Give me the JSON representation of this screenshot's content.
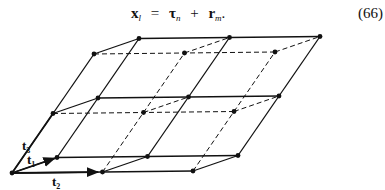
{
  "equation": {
    "lhs": "x",
    "lhs_sub": "l",
    "equals": "=",
    "term1": "τ",
    "term1_sub": "n",
    "plus": "+",
    "term2": "r",
    "term2_sub": "m",
    "trailing": ".",
    "number": "(66)"
  },
  "diagram": {
    "grid": {
      "n_t2": 3,
      "n_t1": 2,
      "n_t3": 3
    },
    "vectors": [
      {
        "name": "t1",
        "label": "t",
        "sub": "1"
      },
      {
        "name": "t2",
        "label": "t",
        "sub": "2"
      },
      {
        "name": "t3",
        "label": "t",
        "sub": "3"
      }
    ],
    "colors": {
      "line": "#111111",
      "point": "#111111"
    }
  }
}
